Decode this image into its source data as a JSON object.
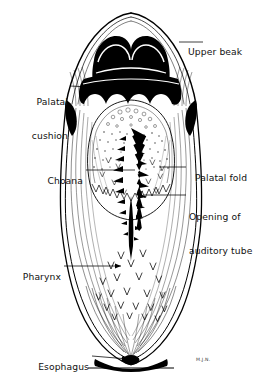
{
  "figure": {
    "background_color": "#ffffff",
    "ink_color": "#000000",
    "signature": "M.J.N."
  },
  "labels": [
    {
      "id": "upper-beak",
      "text": "Upper beak",
      "lines": [
        "Upper beak"
      ],
      "side": "right",
      "x": 184,
      "y": 37,
      "leader": {
        "x1": 179,
        "y1": 42,
        "x2": 203,
        "y2": 42
      },
      "arrow": false
    },
    {
      "id": "palatal-cushion",
      "text": "Palatal cushion",
      "lines": [
        "Palatal",
        "cushion"
      ],
      "side": "left",
      "x": 24,
      "y": 79,
      "leader": {
        "x1": 70,
        "y1": 85,
        "x2": 110,
        "y2": 88
      },
      "arrow": false
    },
    {
      "id": "choana",
      "text": "Choana",
      "lines": [
        "Choana"
      ],
      "side": "left",
      "x": 38,
      "y": 165,
      "leader": {
        "x1": 86,
        "y1": 170,
        "x2": 135,
        "y2": 170
      },
      "arrow": false
    },
    {
      "id": "palatal-fold",
      "text": "Palatal fold",
      "lines": [
        "Palatal fold"
      ],
      "side": "right",
      "x": 188,
      "y": 162,
      "leader": {
        "x1": 159,
        "y1": 167,
        "x2": 186,
        "y2": 167
      },
      "arrow": false
    },
    {
      "id": "auditory-tube",
      "text": "Opening of auditory tube",
      "lines": [
        "Opening of",
        "auditory tube"
      ],
      "side": "right",
      "x": 188,
      "y": 189,
      "leader": {
        "x1": 144,
        "y1": 195,
        "x2": 186,
        "y2": 195
      },
      "arrow": false
    },
    {
      "id": "pharynx",
      "text": "Pharynx",
      "lines": [
        "Pharynx"
      ],
      "side": "left",
      "x": 16,
      "y": 261,
      "leader": {
        "x1": 64,
        "y1": 266,
        "x2": 121,
        "y2": 266
      },
      "arrow": true
    },
    {
      "id": "esophagus",
      "text": "Esophagus",
      "lines": [
        "Esophagus"
      ],
      "side": "left",
      "x": 30,
      "y": 351,
      "leader": {
        "x1": 92,
        "y1": 356,
        "x2": 131,
        "y2": 359
      },
      "arrow": true
    }
  ]
}
